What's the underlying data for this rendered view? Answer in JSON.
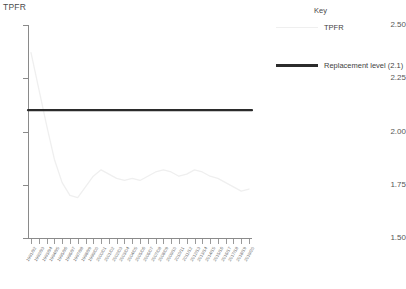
{
  "chart_data": {
    "type": "line",
    "title": "",
    "xlabel": "",
    "ylabel": "TPFR",
    "ylim": [
      1.5,
      2.5
    ],
    "yticks": [
      "1.50",
      "1.75",
      "2.00",
      "2.25",
      "2.50"
    ],
    "grid": false,
    "legend_position": "top-right",
    "categories": [
      "1991/92",
      "1992/93",
      "1993/94",
      "1994/95",
      "1995/96",
      "1996/97",
      "1997/98",
      "1998/99",
      "1999/00",
      "2000/01",
      "2001/02",
      "2002/03",
      "2003/04",
      "2004/05",
      "2005/06",
      "2006/07",
      "2007/08",
      "2008/09",
      "2009/10",
      "2010/11",
      "2011/12",
      "2012/13",
      "2013/14",
      "2014/15",
      "2015/16",
      "2016/17",
      "2017/18",
      "2018/19",
      "2019/20"
    ],
    "series": [
      {
        "name": "TPFR",
        "color": "#efefef",
        "values": [
          2.37,
          2.2,
          2.03,
          1.87,
          1.76,
          1.7,
          1.69,
          1.74,
          1.79,
          1.82,
          1.8,
          1.78,
          1.77,
          1.78,
          1.77,
          1.79,
          1.81,
          1.82,
          1.81,
          1.79,
          1.8,
          1.82,
          1.81,
          1.79,
          1.78,
          1.76,
          1.74,
          1.72,
          1.73
        ]
      },
      {
        "name": "Replacement level (2.1)",
        "color": "#2b2b2b",
        "constant": 2.1
      }
    ]
  },
  "axes": {
    "y_title": "TPFR"
  },
  "legend": {
    "title": "Key",
    "entries": [
      {
        "label": "TPFR",
        "color": "#efefef",
        "style": "thin"
      },
      {
        "label": "Replacement level (2.1)",
        "color": "#2b2b2b",
        "style": "thick"
      }
    ]
  }
}
